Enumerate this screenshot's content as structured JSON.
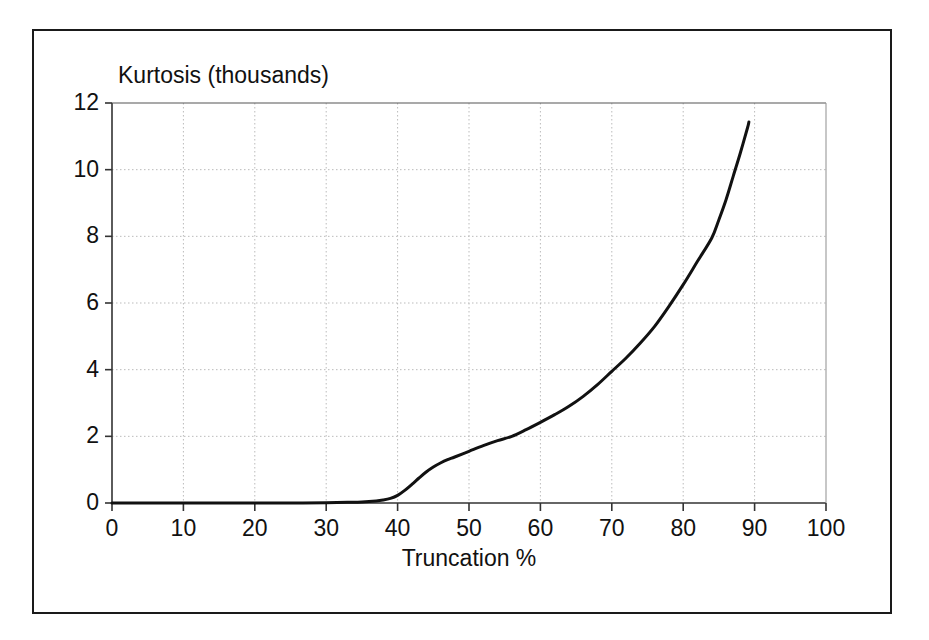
{
  "chart_data": {
    "type": "line",
    "title": "Kurtosis (thousands)",
    "xlabel": "Truncation %",
    "ylabel": "",
    "xlim": [
      0,
      100
    ],
    "ylim": [
      0,
      12
    ],
    "xticks": [
      0,
      10,
      20,
      30,
      40,
      50,
      60,
      70,
      80,
      90,
      100
    ],
    "yticks": [
      0,
      2,
      4,
      6,
      8,
      10,
      12
    ],
    "grid": true,
    "grid_style": "dotted",
    "legend": null,
    "series": [
      {
        "name": "Kurtosis",
        "color": "#111111",
        "x": [
          0,
          5,
          10,
          15,
          20,
          25,
          30,
          33,
          35,
          37,
          38,
          39,
          40,
          41,
          42,
          43,
          44,
          45,
          46,
          47,
          48,
          50,
          52,
          54,
          56,
          58,
          60,
          62,
          64,
          66,
          68,
          70,
          72,
          74,
          76,
          78,
          80,
          82,
          84,
          85,
          86,
          87,
          88,
          89,
          89.2
        ],
        "y": [
          0,
          0,
          0,
          0,
          0,
          0,
          0.01,
          0.02,
          0.03,
          0.06,
          0.09,
          0.14,
          0.23,
          0.38,
          0.56,
          0.75,
          0.93,
          1.08,
          1.2,
          1.3,
          1.38,
          1.55,
          1.72,
          1.87,
          2.0,
          2.2,
          2.42,
          2.65,
          2.9,
          3.2,
          3.55,
          3.95,
          4.35,
          4.8,
          5.3,
          5.9,
          6.55,
          7.25,
          7.95,
          8.5,
          9.1,
          9.8,
          10.5,
          11.25,
          11.43
        ]
      }
    ],
    "annotations": []
  },
  "axis": {
    "y_tick_labels": [
      "12",
      "10",
      "8",
      "6",
      "4",
      "2",
      "0"
    ],
    "x_tick_labels": [
      "0",
      "10",
      "20",
      "30",
      "40",
      "50",
      "60",
      "70",
      "80",
      "90",
      "100"
    ]
  },
  "colors": {
    "frame": "#1a1a1a",
    "axis": "#333333",
    "grid": "#bbbbbb",
    "curve": "#111111",
    "background": "#ffffff"
  }
}
